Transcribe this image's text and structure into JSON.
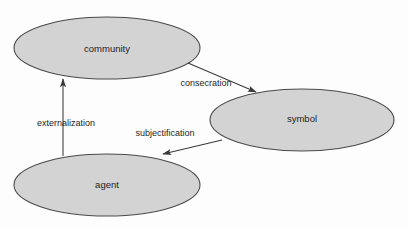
{
  "diagram": {
    "background_color": "#fdfdfd",
    "node_fill_color": "#d3d3d3",
    "node_stroke_color": "#4a4a4a",
    "edge_color": "#3a3a3a",
    "text_color": "#1d1d1d",
    "nodes": [
      {
        "id": "community",
        "label": "community",
        "shape": "ellipse",
        "cx": 107,
        "cy": 48,
        "rx": 93,
        "ry": 31,
        "label_x": 107,
        "label_y": 49
      },
      {
        "id": "symbol",
        "label": "symbol",
        "shape": "ellipse",
        "cx": 302,
        "cy": 120,
        "rx": 92,
        "ry": 31,
        "label_x": 302,
        "label_y": 119
      },
      {
        "id": "agent",
        "label": "agent",
        "shape": "ellipse",
        "cx": 107,
        "cy": 185,
        "rx": 93,
        "ry": 31,
        "label_x": 107,
        "label_y": 185
      }
    ],
    "edges": [
      {
        "id": "consecration",
        "label": "consecration",
        "from": "community",
        "to": "symbol",
        "x1": 188,
        "y1": 63,
        "x2": 256,
        "y2": 92,
        "label_x": 206,
        "label_y": 84,
        "arrow": "end"
      },
      {
        "id": "subjectification",
        "label": "subjectification",
        "from": "symbol",
        "to": "agent",
        "x1": 222,
        "y1": 140,
        "x2": 163,
        "y2": 154,
        "label_x": 165,
        "label_y": 134,
        "arrow": "end"
      },
      {
        "id": "externalization",
        "label": "externalization",
        "from": "agent",
        "to": "community",
        "x1": 63,
        "y1": 156,
        "x2": 63,
        "y2": 79,
        "label_x": 66,
        "label_y": 124,
        "arrow": "end"
      }
    ]
  }
}
